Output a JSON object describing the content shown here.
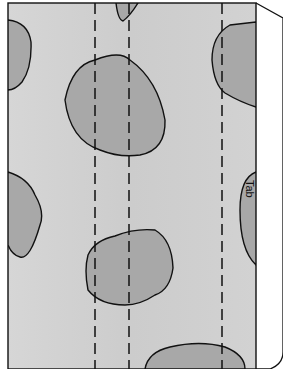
{
  "diagram": {
    "tab_label": "Tab",
    "colors": {
      "paper": "#d2d2d2",
      "spot": "#a8a8a8",
      "outline": "#111111",
      "background": "#ffffff"
    },
    "fold_lines": 3,
    "spots": 8
  }
}
